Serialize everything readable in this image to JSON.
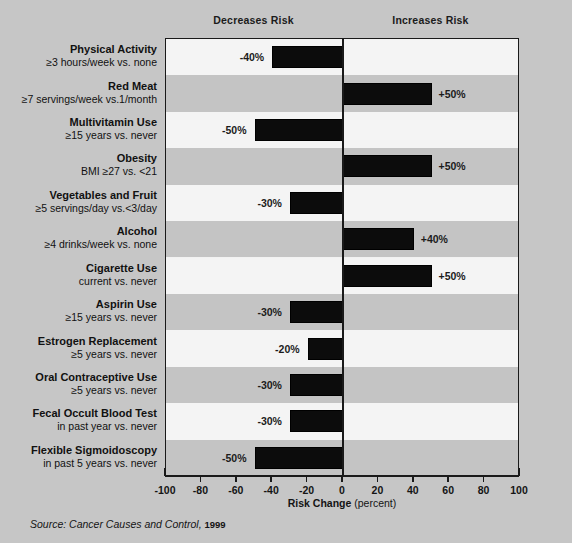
{
  "headers": {
    "decreases": "Decreases Risk",
    "increases": "Increases Risk"
  },
  "axis": {
    "title": "Risk Change",
    "units": "(percent)",
    "tick_labels": [
      "-100",
      "-80",
      "-60",
      "-40",
      "-20",
      "0",
      "20",
      "40",
      "60",
      "80",
      "100"
    ]
  },
  "source": {
    "prefix": "Source: Cancer Causes and Control,",
    "year": "1999"
  },
  "colors": {
    "page_background": "#c6c6c6",
    "band_light": "#f4f4f4",
    "band_dark": "#c4c4c4",
    "bar": "#0c0c0c",
    "axis": "#1a1a1a",
    "text": "#111111"
  },
  "chart_data": {
    "type": "bar",
    "title": "",
    "xlabel": "Risk Change (percent)",
    "ylabel": "",
    "xlim": [
      -100,
      100
    ],
    "xticks": [
      -100,
      -80,
      -60,
      -40,
      -20,
      0,
      20,
      40,
      60,
      80,
      100
    ],
    "orientation": "horizontal",
    "grid": false,
    "legend": null,
    "annotations": [
      "Decreases Risk",
      "Increases Risk"
    ],
    "categories": [
      "Physical Activity",
      "Red Meat",
      "Multivitamin Use",
      "Obesity",
      "Vegetables and Fruit",
      "Alcohol",
      "Cigarette Use",
      "Aspirin Use",
      "Estrogen Replacement",
      "Oral Contraceptive Use",
      "Fecal Occult Blood Test",
      "Flexible Sigmoidoscopy"
    ],
    "values": [
      -40,
      50,
      -50,
      50,
      -30,
      40,
      50,
      -30,
      -20,
      -30,
      -30,
      -50
    ],
    "rows": [
      {
        "name": "Physical Activity",
        "detail": "≥3 hours/week vs. none",
        "value": -40,
        "data_label": "-40%"
      },
      {
        "name": "Red Meat",
        "detail": "≥7 servings/week vs.1/month",
        "value": 50,
        "data_label": "+50%"
      },
      {
        "name": "Multivitamin Use",
        "detail": "≥15 years vs. never",
        "value": -50,
        "data_label": "-50%"
      },
      {
        "name": "Obesity",
        "detail": "BMI ≥27 vs. <21",
        "value": 50,
        "data_label": "+50%"
      },
      {
        "name": "Vegetables and Fruit",
        "detail": "≥5 servings/day vs.<3/day",
        "value": -30,
        "data_label": "-30%"
      },
      {
        "name": "Alcohol",
        "detail": "≥4 drinks/week vs. none",
        "value": 40,
        "data_label": "+40%"
      },
      {
        "name": "Cigarette Use",
        "detail": "current vs. never",
        "value": 50,
        "data_label": "+50%"
      },
      {
        "name": "Aspirin Use",
        "detail": "≥15 years vs. never",
        "value": -30,
        "data_label": "-30%"
      },
      {
        "name": "Estrogen Replacement",
        "detail": "≥5 years vs. never",
        "value": -20,
        "data_label": "-20%"
      },
      {
        "name": "Oral Contraceptive Use",
        "detail": "≥5 years vs. never",
        "value": -30,
        "data_label": "-30%"
      },
      {
        "name": "Fecal Occult Blood Test",
        "detail": "in past year vs. never",
        "value": -30,
        "data_label": "-30%"
      },
      {
        "name": "Flexible Sigmoidoscopy",
        "detail": "in past 5 years vs. never",
        "value": -50,
        "data_label": "-50%"
      }
    ]
  }
}
